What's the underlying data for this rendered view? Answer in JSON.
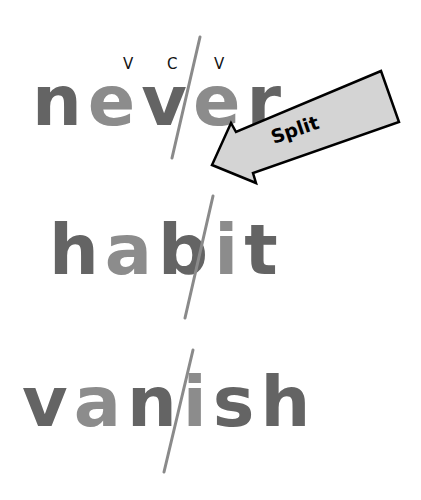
{
  "diagram": {
    "type": "syllable-division",
    "pattern_labels": [
      "V",
      "C",
      "V"
    ],
    "words": [
      {
        "word": "never",
        "letters": [
          "n",
          "e",
          "v",
          "e",
          "r"
        ],
        "shades": [
          "dark",
          "light",
          "dark",
          "light",
          "dark"
        ],
        "split_after_index": 2
      },
      {
        "word": "habit",
        "letters": [
          "h",
          "a",
          "b",
          "i",
          "t"
        ],
        "shades": [
          "dark",
          "light",
          "dark",
          "light",
          "dark"
        ],
        "split_after_index": 2
      },
      {
        "word": "vanish",
        "letters": [
          "v",
          "a",
          "n",
          "i",
          "s",
          "h"
        ],
        "shades": [
          "dark",
          "light",
          "dark",
          "light",
          "dark",
          "dark"
        ],
        "split_after_index": 2
      }
    ],
    "arrow": {
      "label": "Split",
      "fill": "#d4d4d4",
      "stroke": "#000000"
    },
    "colors": {
      "dark_letter": "#646464",
      "light_letter": "#8c8c8c",
      "split_line": "#8a8a8a"
    }
  }
}
